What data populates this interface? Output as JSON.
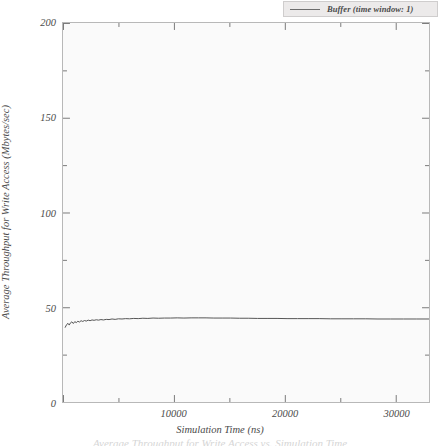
{
  "chart_data": {
    "type": "line",
    "title": "",
    "xlabel": "Simulation Time (ns)",
    "ylabel": "Average Throughput for Write Access (Mbytes/sec)",
    "xlim": [
      0,
      33000
    ],
    "ylim": [
      0,
      200
    ],
    "grid": false,
    "legend_position": "top-right",
    "xticks": [
      0,
      10000,
      20000,
      30000
    ],
    "xtick_labels": [
      "",
      "10000",
      "20000",
      "30000"
    ],
    "xminor_ticks": [
      5000,
      15000,
      25000
    ],
    "yticks": [
      0,
      50,
      100,
      150,
      200
    ],
    "ytick_labels": [
      "0",
      "50",
      "100",
      "150",
      "200"
    ],
    "yminor_ticks": [
      25,
      75,
      125,
      175
    ],
    "series": [
      {
        "name": "Buffer (time window: 1)",
        "color": "#555555",
        "x": [
          200,
          330,
          450,
          560,
          680,
          800,
          930,
          1060,
          1200,
          1340,
          1480,
          1630,
          1780,
          1940,
          2100,
          2270,
          2440,
          2620,
          2800,
          3000,
          3200,
          3420,
          3650,
          3900,
          4150,
          4420,
          4700,
          5000,
          5320,
          5650,
          6000,
          6380,
          6780,
          7200,
          7650,
          8120,
          8620,
          9150,
          9700,
          10300,
          10900,
          11550,
          12200,
          12900,
          13600,
          14350,
          15100,
          15900,
          16700,
          17550,
          18400,
          19300,
          20200,
          21150,
          22100,
          23100,
          24100,
          25150,
          26200,
          27300,
          28400,
          29550,
          30700,
          31900,
          33000
        ],
        "y": [
          39.4,
          40.9,
          41.5,
          40.6,
          41.8,
          42.3,
          41.4,
          42.4,
          41.9,
          42.6,
          42.2,
          42.9,
          42.5,
          43.0,
          42.7,
          43.2,
          42.9,
          43.3,
          43.1,
          43.4,
          43.2,
          43.5,
          43.3,
          43.6,
          43.5,
          43.8,
          43.6,
          43.9,
          43.8,
          44.0,
          43.9,
          44.1,
          44.0,
          44.2,
          44.1,
          44.3,
          44.2,
          44.3,
          44.3,
          44.4,
          44.3,
          44.4,
          44.4,
          44.4,
          44.3,
          44.3,
          44.3,
          44.2,
          44.2,
          44.1,
          44.1,
          44.1,
          44.0,
          44.0,
          44.0,
          44.0,
          43.9,
          43.9,
          43.9,
          43.9,
          43.8,
          43.8,
          43.8,
          43.8,
          43.8
        ]
      }
    ]
  },
  "legend": {
    "label": "Buffer (time window: 1)"
  },
  "axes": {
    "x_title": "Simulation Time (ns)",
    "y_title": "Average Throughput for Write Access (Mbytes/sec)",
    "x_labels": [
      "10000",
      "20000",
      "30000"
    ],
    "y_labels": [
      "0",
      "50",
      "100",
      "150",
      "200"
    ]
  },
  "colors": {
    "line": "#555555",
    "plot_background": "#fafafa",
    "frame": "#b8b8b8",
    "legend_background": "#eceaea",
    "text": "#4b4b4b"
  },
  "caption_remnant": "Average Throughput for Write Access vs. Simulation Time"
}
